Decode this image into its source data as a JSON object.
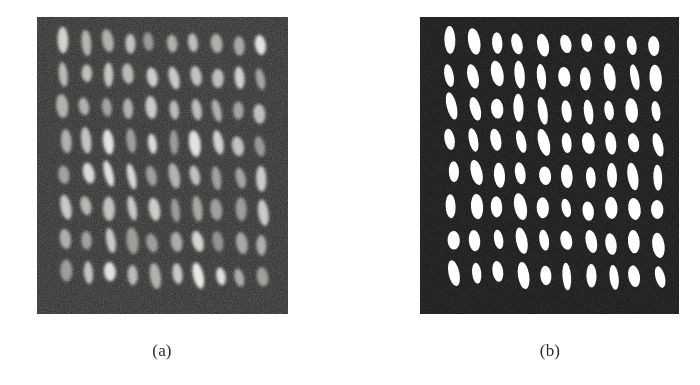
{
  "figure": {
    "type": "two-panel-image-figure",
    "background_color": "#ffffff",
    "width": 700,
    "height": 385
  },
  "panels": [
    {
      "id": "a",
      "caption": "(a)",
      "role": "raw-grayscale-micrograph",
      "x": 37,
      "y": 17,
      "width": 251,
      "height": 297,
      "background_color": "#2a2a2a",
      "feature_color": "#c8c8c8",
      "feature_color_core": "#e0ded8",
      "feature_shape": "ellipse",
      "grid_rows": 8,
      "grid_cols": 10,
      "blur_px": 1.6,
      "noise": "high",
      "contrast": "low"
    },
    {
      "id": "b",
      "caption": "(b)",
      "role": "binarized-segmented-image",
      "x": 420,
      "y": 17,
      "width": 259,
      "height": 297,
      "background_color": "#151515",
      "feature_color": "#ffffff",
      "feature_color_core": "#ffffff",
      "feature_shape": "ellipse",
      "grid_rows": 8,
      "grid_cols": 10,
      "blur_px": 0.35,
      "noise": "low",
      "contrast": "high"
    }
  ],
  "captions": {
    "panel_a": "(a)",
    "panel_b": "(b)"
  },
  "chart_data": {
    "type": "heatmap",
    "title": "",
    "xlabel": "",
    "ylabel": "",
    "rows": 8,
    "cols": 10,
    "cell_count": 80,
    "panel_a": {
      "caption": "(a)",
      "background_level": 42,
      "feature_level": 205,
      "ellipse_rx_px": 5.0,
      "ellipse_ry_px": 11.0,
      "tilt_deg": -8,
      "col_spacing_px": 22.0,
      "row_spacing_px": 33.0,
      "origin_x_px": 26,
      "origin_y_px": 24
    },
    "panel_b": {
      "caption": "(b)",
      "background_level": 21,
      "feature_level": 255,
      "ellipse_rx_px": 5.2,
      "ellipse_ry_px": 11.5,
      "tilt_deg": -8,
      "col_spacing_px": 23.0,
      "row_spacing_px": 33.0,
      "origin_x_px": 30,
      "origin_y_px": 24
    },
    "jitter_seed": 7
  }
}
